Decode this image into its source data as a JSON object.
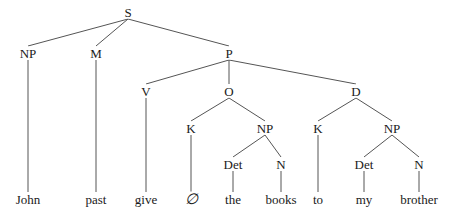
{
  "diagram": {
    "type": "syntax-tree",
    "nodes": [
      {
        "id": "S",
        "label": "S",
        "x": 128,
        "y": 12,
        "kind": "cat"
      },
      {
        "id": "NP1",
        "label": "NP",
        "x": 28,
        "y": 53,
        "kind": "cat"
      },
      {
        "id": "M",
        "label": "M",
        "x": 96,
        "y": 53,
        "kind": "cat"
      },
      {
        "id": "P",
        "label": "P",
        "x": 229,
        "y": 53,
        "kind": "cat"
      },
      {
        "id": "V",
        "label": "V",
        "x": 146,
        "y": 91,
        "kind": "cat"
      },
      {
        "id": "O",
        "label": "O",
        "x": 229,
        "y": 91,
        "kind": "cat"
      },
      {
        "id": "D",
        "label": "D",
        "x": 356,
        "y": 91,
        "kind": "cat"
      },
      {
        "id": "K1",
        "label": "K",
        "x": 191,
        "y": 128,
        "kind": "cat"
      },
      {
        "id": "NP2",
        "label": "NP",
        "x": 265,
        "y": 128,
        "kind": "cat"
      },
      {
        "id": "K2",
        "label": "K",
        "x": 318,
        "y": 128,
        "kind": "cat"
      },
      {
        "id": "NP3",
        "label": "NP",
        "x": 392,
        "y": 128,
        "kind": "cat"
      },
      {
        "id": "Det1",
        "label": "Det",
        "x": 233,
        "y": 164,
        "kind": "cat"
      },
      {
        "id": "N1",
        "label": "N",
        "x": 281,
        "y": 164,
        "kind": "cat"
      },
      {
        "id": "Det2",
        "label": "Det",
        "x": 364,
        "y": 164,
        "kind": "cat"
      },
      {
        "id": "N2",
        "label": "N",
        "x": 419,
        "y": 164,
        "kind": "cat"
      },
      {
        "id": "w1",
        "label": "John",
        "x": 28,
        "y": 199,
        "kind": "word"
      },
      {
        "id": "w2",
        "label": "past",
        "x": 96,
        "y": 199,
        "kind": "word"
      },
      {
        "id": "w3",
        "label": "give",
        "x": 146,
        "y": 199,
        "kind": "word"
      },
      {
        "id": "w4",
        "label": "∅",
        "x": 191,
        "y": 199,
        "kind": "empty"
      },
      {
        "id": "w5",
        "label": "the",
        "x": 233,
        "y": 199,
        "kind": "word"
      },
      {
        "id": "w6",
        "label": "books",
        "x": 281,
        "y": 199,
        "kind": "word"
      },
      {
        "id": "w7",
        "label": "to",
        "x": 318,
        "y": 199,
        "kind": "word"
      },
      {
        "id": "w8",
        "label": "my",
        "x": 364,
        "y": 199,
        "kind": "word"
      },
      {
        "id": "w9",
        "label": "brother",
        "x": 419,
        "y": 199,
        "kind": "word"
      }
    ],
    "edges": [
      [
        "S",
        "NP1"
      ],
      [
        "S",
        "M"
      ],
      [
        "S",
        "P"
      ],
      [
        "NP1",
        "w1"
      ],
      [
        "M",
        "w2"
      ],
      [
        "P",
        "V"
      ],
      [
        "P",
        "O"
      ],
      [
        "P",
        "D"
      ],
      [
        "V",
        "w3"
      ],
      [
        "O",
        "K1"
      ],
      [
        "O",
        "NP2"
      ],
      [
        "K1",
        "w4"
      ],
      [
        "NP2",
        "Det1"
      ],
      [
        "NP2",
        "N1"
      ],
      [
        "Det1",
        "w5"
      ],
      [
        "N1",
        "w6"
      ],
      [
        "D",
        "K2"
      ],
      [
        "D",
        "NP3"
      ],
      [
        "K2",
        "w7"
      ],
      [
        "NP3",
        "Det2"
      ],
      [
        "NP3",
        "N2"
      ],
      [
        "Det2",
        "w8"
      ],
      [
        "N2",
        "w9"
      ]
    ],
    "colors": {
      "edge": "#555555",
      "text": "#1a1a1a",
      "background": "#ffffff"
    }
  }
}
